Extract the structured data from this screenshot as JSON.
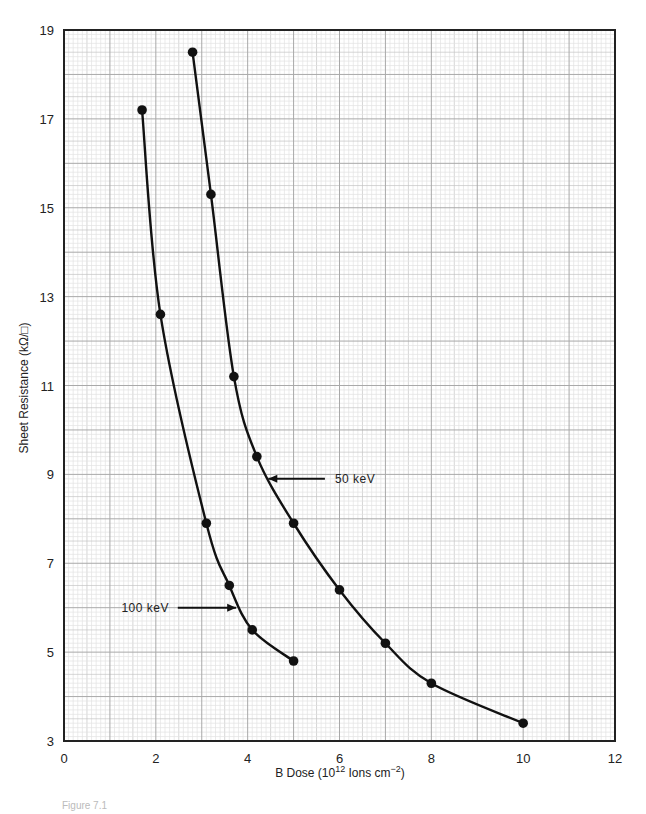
{
  "chart_data": {
    "type": "line",
    "title": "",
    "xlabel": "B Dose (10^12 Ions cm^-2)",
    "xlabel_parts": {
      "pre": "B Dose (10",
      "sup1": "12",
      "mid": " Ions cm",
      "sup2": "−2",
      "post": ")"
    },
    "ylabel": "Sheet Resistance (kΩ/□)",
    "xlim": [
      0,
      12
    ],
    "ylim": [
      3,
      19
    ],
    "xticks": [
      0,
      2,
      4,
      6,
      8,
      10,
      12
    ],
    "yticks": [
      3,
      5,
      7,
      9,
      11,
      13,
      15,
      17,
      19
    ],
    "grid": true,
    "legend": "inline annotations with arrows",
    "series": [
      {
        "name": "100 keV",
        "x": [
          1.7,
          2.1,
          3.1,
          3.6,
          4.1,
          5.0
        ],
        "y": [
          17.2,
          12.6,
          7.9,
          6.5,
          5.5,
          4.8
        ],
        "annotation": {
          "label": "100 keV",
          "text_x": 1.25,
          "text_y": 6.0,
          "arrow_to_x": 3.75,
          "arrow_to_y": 6.0
        }
      },
      {
        "name": "50 keV",
        "x": [
          2.8,
          3.2,
          3.7,
          4.2,
          5.0,
          6.0,
          7.0,
          8.0,
          10.0
        ],
        "y": [
          18.5,
          15.3,
          11.2,
          9.4,
          7.9,
          6.4,
          5.2,
          4.3,
          3.4
        ],
        "annotation": {
          "label": "50 keV",
          "text_x": 5.9,
          "text_y": 8.9,
          "arrow_to_x": 4.45,
          "arrow_to_y": 8.9
        }
      }
    ]
  },
  "caption": "Figure 7.1"
}
